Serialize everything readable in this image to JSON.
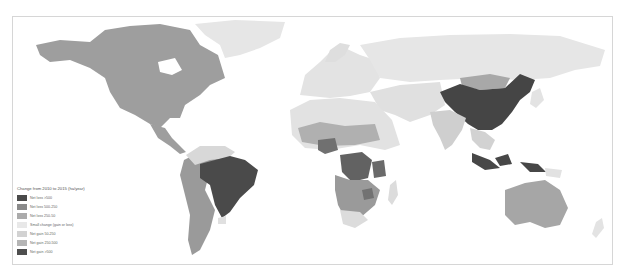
{
  "map": {
    "type": "choropleth-world",
    "colors": {
      "ocean": "#ffffff",
      "frame": "#d6d6d6",
      "loss_high": "#4a4a4a",
      "loss_mid": "#8a8a8a",
      "loss_low": "#ababab",
      "small": "#e3e3e3",
      "gain_low": "#d2d2d2",
      "gain_mid": "#b5b5b5",
      "gain_high": "#4e4e4e"
    },
    "regions": [
      {
        "name": "north-america",
        "class": "loss_mid"
      },
      {
        "name": "greenland",
        "class": "small"
      },
      {
        "name": "central-america",
        "class": "loss_mid"
      },
      {
        "name": "brazil",
        "class": "loss_high"
      },
      {
        "name": "south-america-west",
        "class": "loss_mid"
      },
      {
        "name": "europe",
        "class": "small"
      },
      {
        "name": "russia",
        "class": "small"
      },
      {
        "name": "china",
        "class": "gain_high"
      },
      {
        "name": "mongolia",
        "class": "gain_mid"
      },
      {
        "name": "india",
        "class": "gain_low"
      },
      {
        "name": "africa-north",
        "class": "small"
      },
      {
        "name": "africa-central",
        "class": "loss_high"
      },
      {
        "name": "africa-south",
        "class": "loss_mid"
      },
      {
        "name": "indonesia",
        "class": "loss_high"
      },
      {
        "name": "australia",
        "class": "loss_mid"
      }
    ]
  },
  "legend": {
    "title": "Change from 2010 to 2015 (ha/year)",
    "items": [
      {
        "label": "Net loss >500",
        "color": "#4a4a4a"
      },
      {
        "label": "Net loss 500-250",
        "color": "#8a8a8a"
      },
      {
        "label": "Net loss 250-50",
        "color": "#ababab"
      },
      {
        "label": "Small change (gain or loss)",
        "color": "#e8e8e8"
      },
      {
        "label": "Net gain 50-250",
        "color": "#d2d2d2"
      },
      {
        "label": "Net gain 250-500",
        "color": "#b5b5b5"
      },
      {
        "label": "Net gain >500",
        "color": "#4e4e4e"
      }
    ]
  }
}
